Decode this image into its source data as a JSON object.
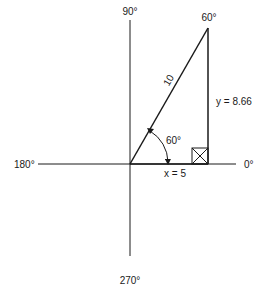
{
  "diagram": {
    "type": "right-triangle-on-axes",
    "axes": {
      "top_label": "90°",
      "bottom_label": "270°",
      "left_label": "180°",
      "right_label": "0°"
    },
    "triangle": {
      "hypotenuse_label": "10",
      "apex_angle_label": "60°",
      "base_angle_label": "60°",
      "adjacent_label": "x = 5",
      "opposite_label": "y = 8.66"
    },
    "colors": {
      "line": "#1a1a1a",
      "background": "#ffffff"
    }
  }
}
